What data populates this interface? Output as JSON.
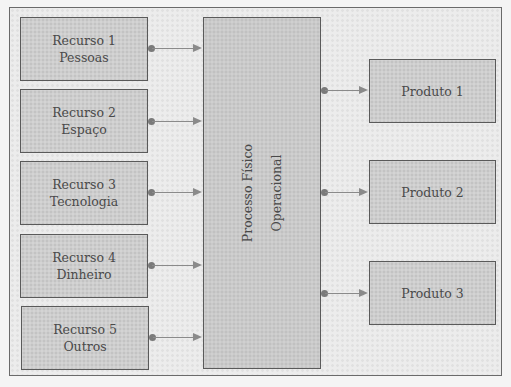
{
  "diagram": {
    "resources": [
      {
        "title": "Recurso 1",
        "subtitle": "Pessoas"
      },
      {
        "title": "Recurso 2",
        "subtitle": "Espaço"
      },
      {
        "title": "Recurso 3",
        "subtitle": "Tecnologia"
      },
      {
        "title": "Recurso 4",
        "subtitle": "Dinheiro"
      },
      {
        "title": "Recurso 5",
        "subtitle": "Outros"
      }
    ],
    "process": {
      "line1": "Processo Físico",
      "line2": "Operacional"
    },
    "products": [
      {
        "label": "Produto 1"
      },
      {
        "label": "Produto 2"
      },
      {
        "label": "Produto 3"
      }
    ],
    "colors": {
      "box_fill": "#d4d4d4",
      "border": "#5a5a5a",
      "arrow": "#8a8a8a",
      "background": "#ececec"
    }
  }
}
